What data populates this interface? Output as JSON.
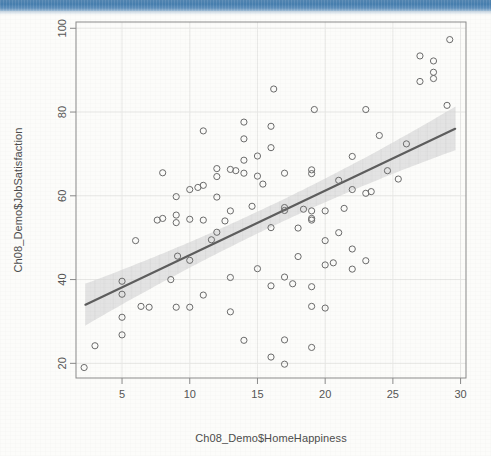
{
  "page": {
    "background_color": "#fcfcfa",
    "banner_color": "#3d78ab"
  },
  "chart_data": {
    "type": "scatter",
    "title": "",
    "subtitle": "",
    "xlabel": "Ch08_Demo$HomeHappiness",
    "ylabel": "Ch08_Demo$JobSatisfaction",
    "xlim": [
      1.6,
      30.4
    ],
    "ylim": [
      16.5,
      101.5
    ],
    "xticks": [
      5,
      10,
      15,
      20,
      25,
      30
    ],
    "yticks": [
      20,
      40,
      60,
      80,
      100
    ],
    "xtick_labels": [
      "5",
      "10",
      "15",
      "20",
      "25",
      "30"
    ],
    "ytick_labels": [
      "20",
      "40",
      "60",
      "80",
      "100"
    ],
    "grid": true,
    "legend": false,
    "legend_position": "none",
    "marker": "open-circle",
    "marker_color": "#6b6b6b",
    "marker_radius_px": 3.1,
    "point_count": 101,
    "points": [
      [
        2.2,
        19.0
      ],
      [
        3.0,
        24.2
      ],
      [
        5.0,
        26.8
      ],
      [
        5.0,
        31.0
      ],
      [
        5.0,
        36.5
      ],
      [
        5.0,
        39.6
      ],
      [
        6.0,
        49.3
      ],
      [
        7.0,
        33.4
      ],
      [
        8.0,
        54.6
      ],
      [
        8.0,
        65.5
      ],
      [
        9.0,
        33.4
      ],
      [
        9.0,
        53.6
      ],
      [
        9.0,
        55.4
      ],
      [
        9.0,
        59.8
      ],
      [
        9.1,
        45.6
      ],
      [
        10.0,
        33.4
      ],
      [
        10.0,
        44.6
      ],
      [
        10.0,
        54.4
      ],
      [
        10.0,
        61.5
      ],
      [
        11.0,
        36.3
      ],
      [
        11.0,
        54.2
      ],
      [
        11.0,
        62.5
      ],
      [
        11.0,
        75.5
      ],
      [
        12.0,
        51.3
      ],
      [
        12.0,
        59.7
      ],
      [
        12.0,
        64.6
      ],
      [
        12.0,
        66.5
      ],
      [
        13.0,
        32.3
      ],
      [
        13.0,
        40.5
      ],
      [
        13.0,
        56.4
      ],
      [
        13.0,
        66.3
      ],
      [
        14.0,
        25.5
      ],
      [
        14.0,
        65.4
      ],
      [
        14.0,
        68.5
      ],
      [
        14.0,
        73.6
      ],
      [
        14.0,
        77.6
      ],
      [
        15.0,
        42.6
      ],
      [
        15.0,
        64.7
      ],
      [
        15.0,
        69.5
      ],
      [
        16.0,
        21.5
      ],
      [
        16.0,
        38.5
      ],
      [
        16.0,
        52.4
      ],
      [
        16.0,
        71.5
      ],
      [
        16.0,
        76.6
      ],
      [
        16.2,
        85.5
      ],
      [
        17.0,
        19.8
      ],
      [
        17.0,
        25.6
      ],
      [
        17.0,
        40.6
      ],
      [
        17.0,
        56.5
      ],
      [
        17.0,
        57.2
      ],
      [
        17.0,
        65.4
      ],
      [
        18.0,
        45.5
      ],
      [
        18.0,
        52.3
      ],
      [
        19.0,
        23.8
      ],
      [
        19.0,
        33.6
      ],
      [
        19.0,
        38.3
      ],
      [
        19.0,
        54.2
      ],
      [
        19.0,
        54.6
      ],
      [
        19.0,
        56.4
      ],
      [
        19.0,
        65.3
      ],
      [
        19.0,
        66.2
      ],
      [
        19.2,
        80.6
      ],
      [
        20.0,
        33.2
      ],
      [
        20.0,
        43.5
      ],
      [
        20.0,
        49.3
      ],
      [
        20.0,
        56.4
      ],
      [
        21.0,
        51.2
      ],
      [
        21.0,
        63.7
      ],
      [
        22.0,
        42.5
      ],
      [
        22.0,
        47.3
      ],
      [
        22.0,
        61.5
      ],
      [
        22.0,
        69.4
      ],
      [
        23.0,
        44.5
      ],
      [
        23.0,
        60.6
      ],
      [
        23.0,
        80.6
      ],
      [
        24.0,
        74.4
      ],
      [
        26.0,
        72.4
      ],
      [
        27.0,
        87.3
      ],
      [
        27.0,
        93.4
      ],
      [
        28.0,
        88.0
      ],
      [
        28.0,
        89.5
      ],
      [
        28.0,
        92.2
      ],
      [
        29.0,
        81.6
      ],
      [
        29.2,
        97.3
      ],
      [
        6.4,
        33.6
      ],
      [
        10.6,
        62.0
      ],
      [
        12.6,
        54.0
      ],
      [
        13.4,
        66.0
      ],
      [
        15.4,
        62.8
      ],
      [
        17.6,
        39.0
      ],
      [
        18.4,
        56.8
      ],
      [
        20.6,
        44.0
      ],
      [
        21.4,
        57.0
      ],
      [
        23.4,
        61.0
      ],
      [
        11.6,
        49.5
      ],
      [
        14.6,
        57.5
      ],
      [
        8.6,
        40.0
      ],
      [
        7.6,
        54.2
      ],
      [
        24.6,
        66.0
      ],
      [
        25.4,
        64.0
      ]
    ],
    "regression_line": {
      "label": "least-squares fit",
      "color": "#5d5d5d",
      "width_px": 2.2,
      "x_start": 2.3,
      "y_start": 34.0,
      "x_end": 29.6,
      "y_end": 76.0,
      "slope": 1.54,
      "intercept": 30.5
    },
    "confidence_band": {
      "label": "confidence interval",
      "color": "#d9d9d9",
      "opacity": 0.72,
      "x_start": 2.3,
      "x_end": 29.6,
      "half_width_start": 5.0,
      "half_width_mid": 2.6,
      "half_width_end": 5.2
    }
  }
}
